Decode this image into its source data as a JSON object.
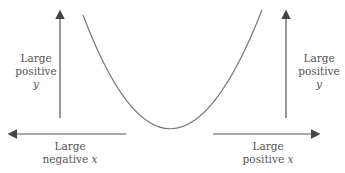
{
  "diagram": {
    "labels": {
      "left_y": {
        "line1": "Large",
        "line2": "positive",
        "var": "y"
      },
      "right_y": {
        "line1": "Large",
        "line2": "positive",
        "var": "y"
      },
      "left_x": {
        "line1": "Large",
        "line2": "negative",
        "var": "x"
      },
      "right_x": {
        "line1": "Large",
        "line2": "positive",
        "var": "x"
      }
    },
    "colors": {
      "line": "#555555",
      "curve": "#777777",
      "text": "#555555"
    }
  }
}
